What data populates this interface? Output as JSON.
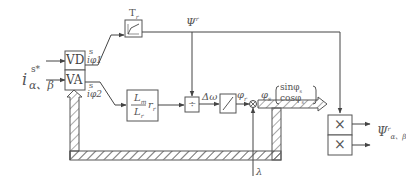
{
  "diagram": {
    "input_label": "i",
    "input_sup": "s*",
    "input_sub": "α、β",
    "vd_block": "VD",
    "va_block": "VA",
    "vd_output_sup": "s",
    "vd_output": "iφ1",
    "va_output_sup": "s",
    "va_output": "iφ2",
    "filter_block_label": "T",
    "filter_block_sub": "r",
    "flux_ref_label": "Ψ",
    "flux_ref_sup": "r",
    "gain_block_num": "L",
    "gain_block_num_sub": "m",
    "gain_block_den": "L",
    "gain_block_den_sub": "r",
    "gain_block_factor": "r",
    "gain_block_factor_sub": "r",
    "divide_block": "÷",
    "delta_omega_label": "Δω",
    "integrator_output_label": "φ",
    "integrator_output_sub": "r",
    "summing_junction": "⊗",
    "angle_label": "φ",
    "angle_sub": "s",
    "matrix_top": "sinφ",
    "matrix_top_sub": "s",
    "matrix_bottom": "cosφ",
    "matrix_bottom_sub": "s",
    "multiplier_symbol": "×",
    "output_label": "Ψ",
    "output_sup": "r",
    "output_sub": "α、β",
    "lambda_label": "λ"
  },
  "colors": {
    "line": "#555555",
    "text": "#444444",
    "background": "#ffffff"
  }
}
